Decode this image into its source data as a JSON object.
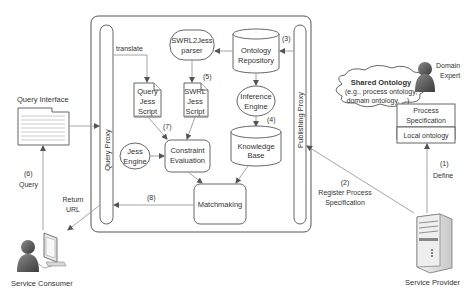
{
  "diagram": {
    "outer_box": {
      "query_proxy_label": "Query Proxy",
      "publishing_proxy_label": "Publishing Proxy"
    },
    "nodes": {
      "translate_label": "translate",
      "swrl2jess_parser": [
        "SWRL2Jess",
        "parser"
      ],
      "ontology_repository": [
        "Ontology",
        "Repository"
      ],
      "query_jess_script": [
        "Query",
        "Jess",
        "Script"
      ],
      "swrl_jess_script": [
        "SWRL",
        "Jess",
        "Script"
      ],
      "inference_engine": [
        "Inference",
        "Engine"
      ],
      "knowledge_base": [
        "Knowledge",
        "Base"
      ],
      "jess_engine": [
        "Jess",
        "Engine"
      ],
      "constraint_evaluation": [
        "Constraint",
        "Evaluation"
      ],
      "matchmaking": "Matchmaking"
    },
    "step_labels": {
      "s1": "(1)",
      "s1_text": "Define",
      "s2": "(2)",
      "s2_text": [
        "Register Process",
        "Specification"
      ],
      "s3": "(3)",
      "s4": "(4)",
      "s5": "(5)",
      "s6": "(6)",
      "s6_text": "Query",
      "s7": "(7)",
      "s8": "(8)",
      "return_url": [
        "Return",
        "URL"
      ]
    },
    "external": {
      "query_interface": "Query Interface",
      "service_consumer": "Service Consumer",
      "service_provider": "Service Provider",
      "domain_expert": [
        "Domain",
        "Expert"
      ],
      "shared_ontology_title": "Shared Ontology",
      "shared_ontology_desc": [
        "(e.g., process ontology,",
        "domain ontology, ...)"
      ],
      "process_specification": [
        "Process",
        "Specification"
      ],
      "local_ontology": "Local ontology"
    }
  }
}
